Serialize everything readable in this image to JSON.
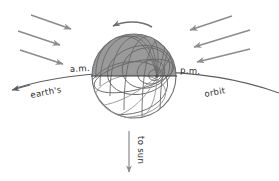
{
  "figure": {
    "type": "diagram",
    "background_color": "#ffffff"
  },
  "labels": {
    "am": "a.m.",
    "pm": "p.m.",
    "earths": "earth's",
    "orbit": "orbit",
    "to_sun": "to sun"
  },
  "colors": {
    "night_shade": "#9a9a9a",
    "day_side": "#ffffff",
    "ray_arrow": "#8c8c8c",
    "orbit_stroke": "#5d5d5d",
    "grid_stroke": "#6a6a6a",
    "text": "#2b2b2b",
    "sun_arrow": "#8a8a8a"
  },
  "globe": {
    "center_x": 134,
    "center_y": 76,
    "radius": 42,
    "pole_x": 157,
    "pole_y": 76,
    "shaded_hemisphere": "upper",
    "terminator_y": 76
  },
  "rays": {
    "left_count": 3,
    "right_count": 3,
    "left_direction": "down-right",
    "right_direction": "down-left"
  },
  "rotation_arrow": {
    "direction": "counterclockwise-westward",
    "points": "left"
  },
  "sun_arrow": {
    "direction": "down",
    "label": "to sun"
  }
}
